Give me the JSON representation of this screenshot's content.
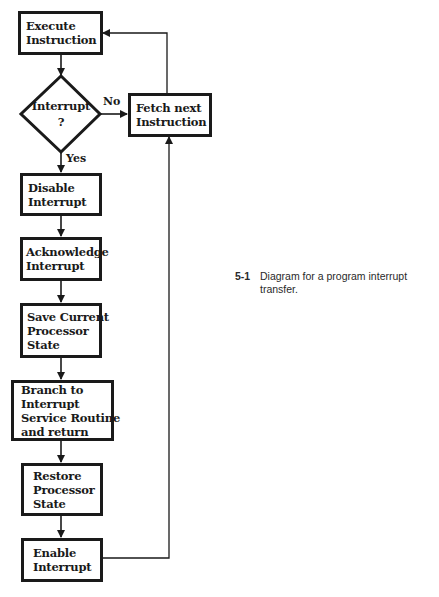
{
  "diagram": {
    "nodes": {
      "execute": {
        "lines": [
          "Execute",
          "Instruction"
        ],
        "shape": "box"
      },
      "decision": {
        "lines": [
          "Interrupt",
          "?"
        ],
        "shape": "diamond"
      },
      "fetch": {
        "lines": [
          "Fetch next",
          "Instruction"
        ],
        "shape": "box"
      },
      "disable": {
        "lines": [
          "Disable",
          "Interrupt"
        ],
        "shape": "box"
      },
      "acknowledge": {
        "lines": [
          "Acknowledge",
          "Interrupt"
        ],
        "shape": "box"
      },
      "save": {
        "lines": [
          "Save Current",
          "Processor",
          "State"
        ],
        "shape": "box"
      },
      "branch": {
        "lines": [
          "Branch to",
          "Interrupt",
          "Service Routine",
          "and return"
        ],
        "shape": "box"
      },
      "restore": {
        "lines": [
          "Restore",
          "Processor",
          "State"
        ],
        "shape": "box"
      },
      "enable": {
        "lines": [
          "Enable",
          "Interrupt"
        ],
        "shape": "box"
      }
    },
    "edges": {
      "no_label": "No",
      "yes_label": "Yes"
    },
    "edge_list": [
      {
        "from": "execute",
        "to": "decision",
        "label": ""
      },
      {
        "from": "decision",
        "to": "fetch",
        "label": "No"
      },
      {
        "from": "decision",
        "to": "disable",
        "label": "Yes"
      },
      {
        "from": "fetch",
        "to": "execute",
        "label": ""
      },
      {
        "from": "disable",
        "to": "acknowledge",
        "label": ""
      },
      {
        "from": "acknowledge",
        "to": "save",
        "label": ""
      },
      {
        "from": "save",
        "to": "branch",
        "label": ""
      },
      {
        "from": "branch",
        "to": "restore",
        "label": ""
      },
      {
        "from": "restore",
        "to": "enable",
        "label": ""
      },
      {
        "from": "enable",
        "to": "fetch",
        "label": ""
      }
    ]
  },
  "caption": {
    "number": "5-1",
    "text": "Diagram for a program interrupt transfer."
  }
}
